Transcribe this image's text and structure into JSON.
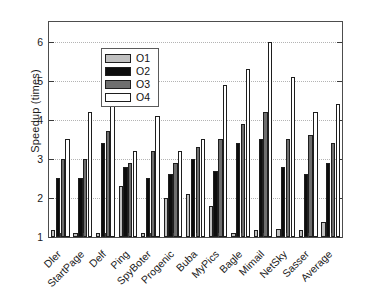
{
  "chart_data": {
    "type": "bar",
    "title": "",
    "xlabel": "",
    "ylabel": "Speedup (times)",
    "ylim": [
      1,
      6.5
    ],
    "yticks": [
      1,
      2,
      3,
      4,
      5,
      6
    ],
    "ytick_labels": [
      "1",
      "2",
      "3",
      "4",
      "5",
      "6"
    ],
    "grid": true,
    "legend_position": "upper left",
    "categories": [
      "Dler",
      "StartPage",
      "Delf",
      "Ping",
      "SpyBoter",
      "Progenic",
      "Buba",
      "MyPics",
      "Bagle",
      "Mimail",
      "NetSky",
      "Sasser",
      "Average"
    ],
    "series": [
      {
        "name": "O1",
        "color": "#c0c0c0",
        "values": [
          1.18,
          1.09,
          1.09,
          2.3,
          1.09,
          2.0,
          2.1,
          1.8,
          1.09,
          1.18,
          1.2,
          1.19,
          1.38
        ]
      },
      {
        "name": "O2",
        "color": "#0d0d0d",
        "values": [
          2.5,
          2.5,
          3.4,
          2.8,
          2.5,
          2.6,
          3.0,
          2.7,
          3.4,
          3.5,
          2.8,
          2.6,
          2.9
        ]
      },
      {
        "name": "O3",
        "color": "#6e6e6e",
        "values": [
          3.0,
          3.0,
          3.7,
          2.9,
          3.2,
          2.9,
          3.3,
          3.5,
          3.9,
          4.2,
          3.5,
          3.6,
          3.4
        ]
      },
      {
        "name": "O4",
        "color": "#ffffff",
        "values": [
          3.5,
          4.2,
          5.0,
          3.2,
          4.1,
          3.2,
          3.5,
          4.9,
          5.3,
          6.0,
          5.1,
          4.2,
          4.4
        ]
      }
    ]
  },
  "legend": {
    "items": [
      {
        "label": "O1"
      },
      {
        "label": "O2"
      },
      {
        "label": "O3"
      },
      {
        "label": "O4"
      }
    ]
  }
}
